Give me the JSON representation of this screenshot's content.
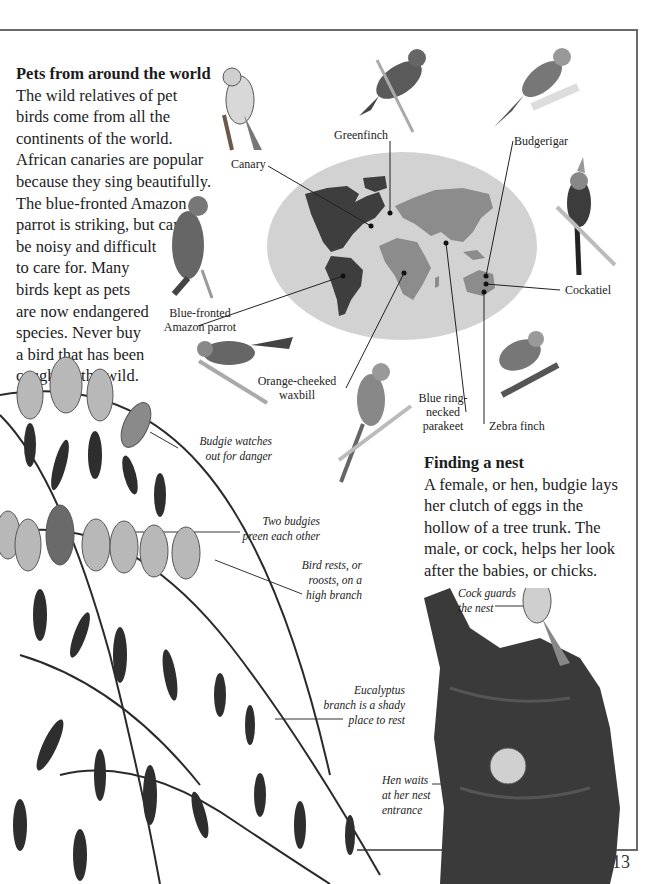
{
  "page": {
    "number": "13"
  },
  "intro": {
    "heading": "Pets from around the world",
    "lines": [
      "The wild relatives of pet",
      "birds come from all the",
      "continents of the world.",
      "African canaries are popular",
      "because they sing beautifully.",
      "The blue-fronted Amazon",
      "parrot is striking, but can",
      "be noisy and difficult",
      "to care for. Many",
      "birds kept as pets",
      "are now endangered",
      "species. Never buy",
      "a bird that has been",
      "caught in the wild."
    ]
  },
  "nest_section": {
    "heading": "Finding a nest",
    "lines": [
      "A female, or hen, budgie lays",
      "her clutch of eggs in the",
      "hollow of a tree trunk. The",
      "male, or cock, helps her look",
      "after the babies, or chicks."
    ]
  },
  "map_labels": {
    "canary": "Canary",
    "greenfinch": "Greenfinch",
    "budgerigar": "Budgerigar",
    "cockatiel": "Cockatiel",
    "blue_fronted_1": "Blue-fronted",
    "blue_fronted_2": "Amazon parrot",
    "waxbill_1": "Orange-cheeked",
    "waxbill_2": "waxbill",
    "parakeet_1": "Blue ring-",
    "parakeet_2": "necked",
    "parakeet_3": "parakeet",
    "zebra_finch": "Zebra finch"
  },
  "captions": {
    "watches_1": "Budgie watches",
    "watches_2": "out for danger",
    "preen_1": "Two budgies",
    "preen_2": "preen each other",
    "rests_1": "Bird rests, or",
    "rests_2": "roosts, on a",
    "rests_3": "high branch",
    "eucalyptus_1": "Eucalyptus",
    "eucalyptus_2": "branch is a shady",
    "eucalyptus_3": "place to rest",
    "cock_1": "Cock guards",
    "cock_2": "the nest",
    "hen_1": "Hen waits",
    "hen_2": "at her nest",
    "hen_3": "entrance"
  },
  "colors": {
    "map_ocean": "#d2d2d2",
    "map_americas": "#3e3e3e",
    "map_oldworld": "#8c8c8c",
    "frame": "#6a6a6a"
  }
}
